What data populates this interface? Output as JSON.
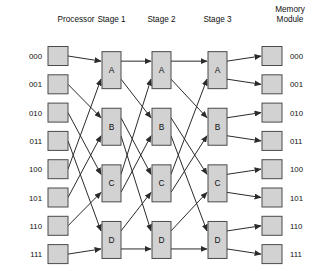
{
  "headers": {
    "processor": "Processor",
    "stage1": "Stage 1",
    "stage2": "Stage 2",
    "stage3": "Stage 3",
    "memory_line1": "Memory",
    "memory_line2": "Module"
  },
  "colors": {
    "box_fill": "#d2d2d2",
    "box_stroke": "#4a4a4a",
    "wire": "#2b2b2b",
    "text": "#101010",
    "background": "#ffffff"
  },
  "processor_labels": [
    "000",
    "001",
    "010",
    "011",
    "100",
    "101",
    "110",
    "111"
  ],
  "memory_labels": [
    "000",
    "001",
    "010",
    "011",
    "100",
    "101",
    "110",
    "111"
  ],
  "switch_labels": [
    "A",
    "B",
    "C",
    "D"
  ],
  "stages": [
    {
      "name": "Stage 1",
      "switches": [
        "A",
        "B",
        "C",
        "D"
      ]
    },
    {
      "name": "Stage 2",
      "switches": [
        "A",
        "B",
        "C",
        "D"
      ]
    },
    {
      "name": "Stage 3",
      "switches": [
        "A",
        "B",
        "C",
        "D"
      ]
    }
  ],
  "geometry": {
    "width": 327,
    "height": 271,
    "row_first_y": 56,
    "row_step": 28.3,
    "proc_box_x": 48,
    "proc_box_w": 20,
    "proc_box_h": 19,
    "mem_box_x": 262,
    "mem_box_w": 20,
    "mem_box_h": 19,
    "stage_x": [
      102,
      152,
      208
    ],
    "stage_box_w": 19,
    "stage_box_h": 37,
    "proc_label_x": 42,
    "mem_label_x": 290,
    "header_y": 22
  },
  "wiring": {
    "description": "perfect shuffle between adjacent columns",
    "proc_to_stage1": [
      [
        0,
        0
      ],
      [
        1,
        2
      ],
      [
        2,
        4
      ],
      [
        3,
        6
      ],
      [
        4,
        1
      ],
      [
        5,
        3
      ],
      [
        6,
        5
      ],
      [
        7,
        7
      ]
    ],
    "stage1_to_stage2": [
      [
        0,
        0
      ],
      [
        1,
        2
      ],
      [
        2,
        4
      ],
      [
        3,
        6
      ],
      [
        4,
        1
      ],
      [
        5,
        3
      ],
      [
        6,
        5
      ],
      [
        7,
        7
      ]
    ],
    "stage2_to_stage3": [
      [
        0,
        0
      ],
      [
        1,
        2
      ],
      [
        2,
        4
      ],
      [
        3,
        6
      ],
      [
        4,
        1
      ],
      [
        5,
        3
      ],
      [
        6,
        5
      ],
      [
        7,
        7
      ]
    ],
    "stage3_to_memory": [
      [
        0,
        0
      ],
      [
        1,
        1
      ],
      [
        2,
        2
      ],
      [
        3,
        3
      ],
      [
        4,
        4
      ],
      [
        5,
        5
      ],
      [
        6,
        6
      ],
      [
        7,
        7
      ]
    ]
  },
  "chart_data": {
    "type": "diagram",
    "columns": [
      "Processor",
      "Stage 1",
      "Stage 2",
      "Stage 3",
      "Memory Module"
    ],
    "nodes_per_column": [
      8,
      4,
      4,
      4,
      8
    ],
    "switch_names": [
      "A",
      "B",
      "C",
      "D"
    ],
    "endpoint_addresses": [
      "000",
      "001",
      "010",
      "011",
      "100",
      "101",
      "110",
      "111"
    ]
  }
}
